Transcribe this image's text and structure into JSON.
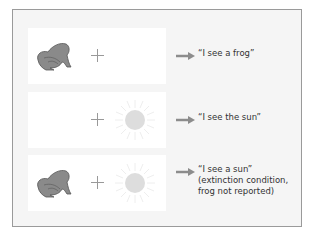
{
  "figure": {
    "rows": [
      {
        "left_stimulus": "frog-icon",
        "center": "fixation-cross",
        "right_stimulus": null,
        "report": "“I see a frog”",
        "note": []
      },
      {
        "left_stimulus": null,
        "center": "fixation-cross",
        "right_stimulus": "sun-icon",
        "report": "“I see the sun”",
        "note": []
      },
      {
        "left_stimulus": "frog-icon",
        "center": "fixation-cross",
        "right_stimulus": "sun-icon",
        "report": "“I see a sun”",
        "note": [
          "(extinction condition,",
          "frog not reported)"
        ]
      }
    ]
  },
  "colors": {
    "frog": "#8a8a8a",
    "sun": "#dddddd",
    "arrow": "#8c8c8c",
    "plus": "#999999",
    "text": "#333333"
  }
}
